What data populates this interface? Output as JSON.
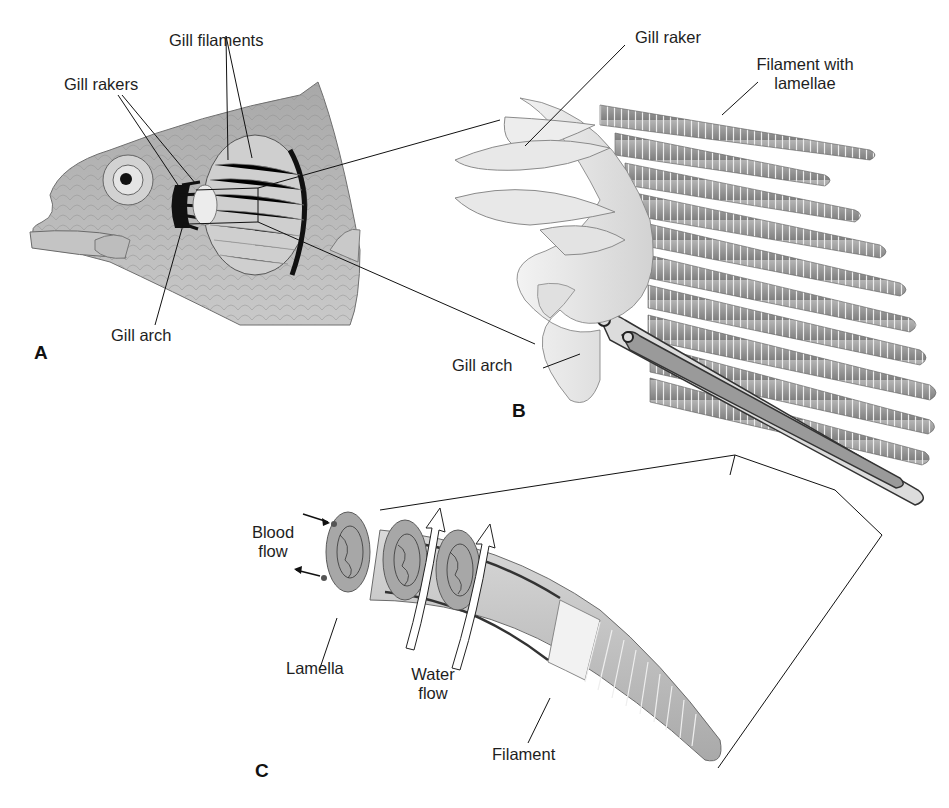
{
  "figure": {
    "panels": [
      {
        "id": "A",
        "letter": "A",
        "subject": "fish head with opercular cover removed showing gills"
      },
      {
        "id": "B",
        "letter": "B",
        "subject": "single gill arch enlarged"
      },
      {
        "id": "C",
        "letter": "C",
        "subject": "single filament with lamellae enlarged"
      }
    ],
    "labels": {
      "gill_filaments": "Gill filaments",
      "gill_rakers": "Gill rakers",
      "gill_arch_a": "Gill arch",
      "gill_raker": "Gill raker",
      "filament_with": "Filament with",
      "lamellae": "lamellae",
      "gill_arch_b": "Gill arch",
      "blood": "Blood",
      "blood_flow": "flow",
      "lamella": "Lamella",
      "water": "Water",
      "water_flow": "flow",
      "filament": "Filament"
    },
    "colors": {
      "background": "#ffffff",
      "ink": "#1e1e1e",
      "fish_body": "#b9b9b9",
      "filament_gray": "#9a9a9a",
      "arch_light": "#e6e6e6"
    }
  }
}
